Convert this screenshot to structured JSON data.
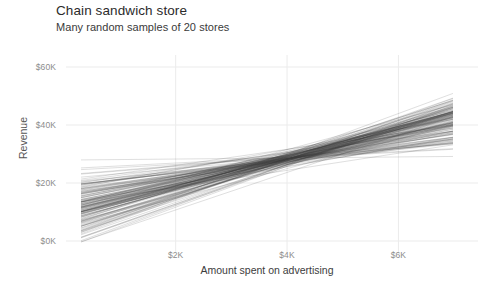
{
  "chart_data": {
    "type": "line",
    "title": "Chain sandwich store",
    "subtitle": "Many random samples of 20 stores",
    "xlabel": "Amount spent on advertising",
    "ylabel": "Revenue",
    "xlim": [
      0,
      7.4
    ],
    "ylim": [
      -2,
      64
    ],
    "x_unit": "$K",
    "y_unit": "$K",
    "xticks": [
      2,
      4,
      6
    ],
    "xtick_labels": [
      "$2K",
      "$4K",
      "$6K"
    ],
    "yticks": [
      0,
      20,
      40,
      60
    ],
    "ytick_labels": [
      "$0K",
      "$20K",
      "$40K",
      "$60K"
    ],
    "grid": true,
    "grid_color": "#ebebeb",
    "legend": null,
    "line_color": "#3f3f3f",
    "line_opacity": 0.3,
    "line_width": 0.55,
    "n_lines": 150,
    "sample_size_per_line": 20,
    "x_start": 0.3,
    "x_end": 6.98,
    "pivot_x": 4.08,
    "pivot_y": 28.6,
    "slope_mean": 4.5,
    "slope_sd": 1.35,
    "intercept_mean": 10.2,
    "series": [
      {
        "name": "sample-001",
        "intercept": 6.2,
        "slope": 5.52
      },
      {
        "name": "sample-002",
        "intercept": 12.8,
        "slope": 3.88
      },
      {
        "name": "sample-003",
        "intercept": 2.1,
        "slope": 6.48
      },
      {
        "name": "sample-004",
        "intercept": 15.4,
        "slope": 3.22
      },
      {
        "name": "sample-005",
        "intercept": 9.05,
        "slope": 4.78
      },
      {
        "name": "sample-006",
        "intercept": 18.6,
        "slope": 2.45
      },
      {
        "name": "sample-007",
        "intercept": 4.4,
        "slope": 5.94
      },
      {
        "name": "sample-008",
        "intercept": 11.2,
        "slope": 4.26
      },
      {
        "name": "sample-009",
        "intercept": 7.8,
        "slope": 5.1
      },
      {
        "name": "sample-010",
        "intercept": 21.5,
        "slope": 1.74
      },
      {
        "name": "sample-011",
        "intercept": 1.3,
        "slope": 6.7
      },
      {
        "name": "sample-012",
        "intercept": 13.9,
        "slope": 3.6
      },
      {
        "name": "sample-013",
        "intercept": 8.6,
        "slope": 4.9
      },
      {
        "name": "sample-014",
        "intercept": 16.8,
        "slope": 2.88
      },
      {
        "name": "sample-015",
        "intercept": 5.1,
        "slope": 5.76
      },
      {
        "name": "sample-016",
        "intercept": 10.4,
        "slope": 4.46
      },
      {
        "name": "sample-017",
        "intercept": 24.3,
        "slope": 1.05
      },
      {
        "name": "sample-018",
        "intercept": 3.2,
        "slope": 6.22
      },
      {
        "name": "sample-019",
        "intercept": 14.6,
        "slope": 3.42
      },
      {
        "name": "sample-020",
        "intercept": 19.7,
        "slope": 2.18
      },
      {
        "name": "sample-021",
        "intercept": 27.9,
        "slope": 0.18
      },
      {
        "name": "sample-022",
        "intercept": 6.9,
        "slope": 5.34
      },
      {
        "name": "sample-023",
        "intercept": 12.1,
        "slope": 4.04
      },
      {
        "name": "sample-024",
        "intercept": 0.4,
        "slope": 6.92
      }
    ]
  }
}
